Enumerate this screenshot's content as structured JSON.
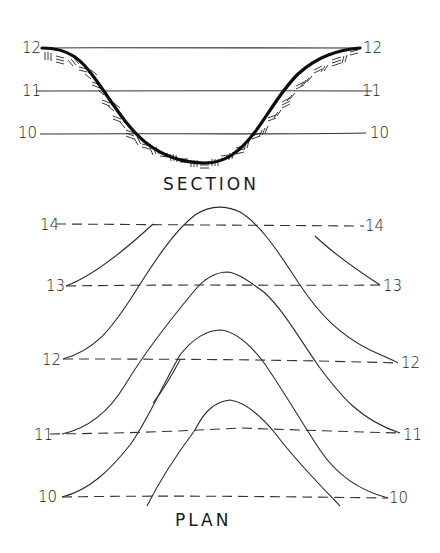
{
  "section": {
    "title": "SECTION",
    "elevation_lines": [
      {
        "left_label": "12",
        "right_label": "12",
        "y": 48
      },
      {
        "left_label": "11",
        "right_label": "11",
        "y": 91
      },
      {
        "left_label": "10",
        "right_label": "10",
        "y": 133
      }
    ]
  },
  "plan": {
    "title": "PLAN",
    "contour_lines": [
      {
        "left_label": "14",
        "right_label": "14",
        "y": 224
      },
      {
        "left_label": "13",
        "right_label": "13",
        "y": 285
      },
      {
        "left_label": "12",
        "right_label": "12",
        "y": 360
      },
      {
        "left_label": "11",
        "right_label": "11",
        "y": 433
      },
      {
        "left_label": "10",
        "right_label": "10",
        "y": 496
      }
    ]
  },
  "colors": {
    "ink": "#1a1a1a",
    "paper": "#ffffff"
  }
}
